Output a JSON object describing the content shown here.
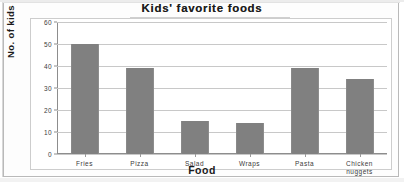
{
  "chart_data": {
    "type": "bar",
    "title": "Kids' favorite foods",
    "xlabel": "Food",
    "ylabel": "No. of kids",
    "categories": [
      "Fries",
      "Pizza",
      "Salad",
      "Wraps",
      "Pasta",
      "Chicken\nnuggets"
    ],
    "values": [
      50,
      39,
      15,
      14,
      39,
      34
    ],
    "ylim": [
      0,
      60
    ],
    "yticks": [
      0,
      10,
      20,
      30,
      40,
      50,
      60
    ],
    "ytick_labels": [
      "0",
      "10",
      "20",
      "30",
      "40",
      "50",
      "60"
    ],
    "grid": true,
    "legend": false,
    "bar_color": "#808080",
    "axis_color": "#8d8d8d",
    "grid_color": "#c8c8c8",
    "background": "#ffffff"
  }
}
